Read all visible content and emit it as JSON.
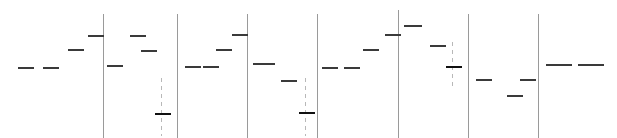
{
  "chart_data": {
    "type": "scatter",
    "title": "",
    "subtitle": "",
    "xlabel": "",
    "ylabel": "",
    "xlim": [
      0,
      617
    ],
    "ylim": [
      0,
      138
    ],
    "grid": false,
    "legend": null,
    "background_color": "#ffffff",
    "mark_color": "#3a3a3a",
    "heavy_mark_color": "#111111",
    "divider_color": "#9a9a9a",
    "ledger_color": "#b8b8b8",
    "panels": [
      {
        "name": "panel-1",
        "x_start": 0,
        "x_end": 103
      },
      {
        "name": "panel-2",
        "x_start": 103,
        "x_end": 177
      },
      {
        "name": "panel-3",
        "x_start": 177,
        "x_end": 247
      },
      {
        "name": "panel-4",
        "x_start": 247,
        "x_end": 317
      },
      {
        "name": "panel-5",
        "x_start": 317,
        "x_end": 398
      },
      {
        "name": "panel-6",
        "x_start": 398,
        "x_end": 468
      },
      {
        "name": "panel-7",
        "x_start": 468,
        "x_end": 538
      },
      {
        "name": "panel-8",
        "x_start": 538,
        "x_end": 617
      }
    ],
    "dividers": [
      {
        "name": "divider-1",
        "x": 103,
        "y": 14,
        "height": 124
      },
      {
        "name": "divider-2",
        "x": 177,
        "y": 14,
        "height": 124
      },
      {
        "name": "divider-3",
        "x": 247,
        "y": 14,
        "height": 124
      },
      {
        "name": "divider-4",
        "x": 317,
        "y": 14,
        "height": 124
      },
      {
        "name": "divider-5",
        "x": 398,
        "y": 10,
        "height": 128
      },
      {
        "name": "divider-6",
        "x": 468,
        "y": 14,
        "height": 124
      },
      {
        "name": "divider-7",
        "x": 538,
        "y": 14,
        "height": 124
      }
    ],
    "ledgers": [
      {
        "name": "ledger-1",
        "x": 161,
        "y": 78,
        "height": 58
      },
      {
        "name": "ledger-2",
        "x": 305,
        "y": 78,
        "height": 58
      },
      {
        "name": "ledger-3",
        "x": 452,
        "y": 42,
        "height": 46
      }
    ],
    "marks": [
      {
        "id": 1,
        "x": 18,
        "y": 67,
        "width": 16,
        "heavy": false
      },
      {
        "id": 2,
        "x": 43,
        "y": 67,
        "width": 16,
        "heavy": false
      },
      {
        "id": 3,
        "x": 68,
        "y": 49,
        "width": 16,
        "heavy": false
      },
      {
        "id": 4,
        "x": 88,
        "y": 35,
        "width": 16,
        "heavy": false
      },
      {
        "id": 5,
        "x": 107,
        "y": 65,
        "width": 16,
        "heavy": false
      },
      {
        "id": 6,
        "x": 130,
        "y": 35,
        "width": 16,
        "heavy": false
      },
      {
        "id": 7,
        "x": 141,
        "y": 50,
        "width": 16,
        "heavy": false
      },
      {
        "id": 8,
        "x": 155,
        "y": 113,
        "width": 16,
        "heavy": true
      },
      {
        "id": 9,
        "x": 185,
        "y": 66,
        "width": 16,
        "heavy": false
      },
      {
        "id": 10,
        "x": 203,
        "y": 66,
        "width": 16,
        "heavy": false
      },
      {
        "id": 11,
        "x": 216,
        "y": 49,
        "width": 16,
        "heavy": false
      },
      {
        "id": 12,
        "x": 232,
        "y": 34,
        "width": 16,
        "heavy": false
      },
      {
        "id": 13,
        "x": 253,
        "y": 63,
        "width": 22,
        "heavy": false
      },
      {
        "id": 14,
        "x": 281,
        "y": 80,
        "width": 16,
        "heavy": false
      },
      {
        "id": 15,
        "x": 299,
        "y": 112,
        "width": 16,
        "heavy": true
      },
      {
        "id": 16,
        "x": 322,
        "y": 67,
        "width": 16,
        "heavy": false
      },
      {
        "id": 17,
        "x": 344,
        "y": 67,
        "width": 16,
        "heavy": false
      },
      {
        "id": 18,
        "x": 363,
        "y": 49,
        "width": 16,
        "heavy": false
      },
      {
        "id": 19,
        "x": 385,
        "y": 34,
        "width": 16,
        "heavy": false
      },
      {
        "id": 20,
        "x": 404,
        "y": 25,
        "width": 18,
        "heavy": false
      },
      {
        "id": 21,
        "x": 430,
        "y": 45,
        "width": 16,
        "heavy": false
      },
      {
        "id": 22,
        "x": 446,
        "y": 66,
        "width": 16,
        "heavy": true
      },
      {
        "id": 23,
        "x": 476,
        "y": 79,
        "width": 16,
        "heavy": false
      },
      {
        "id": 24,
        "x": 507,
        "y": 95,
        "width": 16,
        "heavy": false
      },
      {
        "id": 25,
        "x": 520,
        "y": 79,
        "width": 16,
        "heavy": false
      },
      {
        "id": 26,
        "x": 546,
        "y": 64,
        "width": 26,
        "heavy": false
      },
      {
        "id": 27,
        "x": 578,
        "y": 64,
        "width": 26,
        "heavy": false
      }
    ]
  }
}
